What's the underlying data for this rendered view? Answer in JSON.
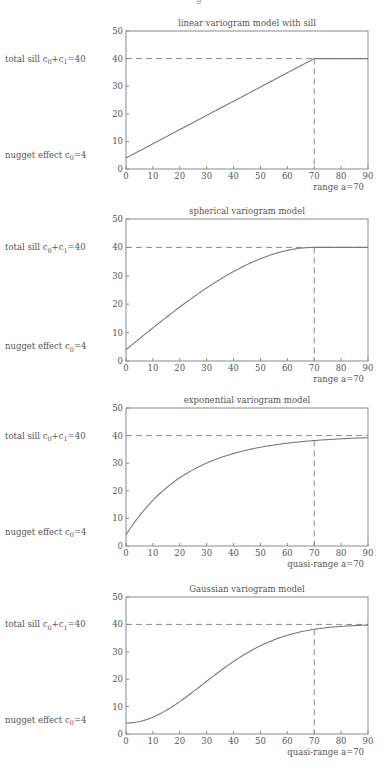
{
  "header_fragment": "g",
  "colors": {
    "axis": "#8a8a8a",
    "curve": "#7a7a7a",
    "dash": "#8a8a8a",
    "text": "#555555"
  },
  "layout": {
    "plot_left": 126,
    "plot_right": 368,
    "panels": [
      {
        "top": 31,
        "bottom": 169
      },
      {
        "top": 219,
        "bottom": 361
      },
      {
        "top": 408,
        "bottom": 546
      },
      {
        "top": 597,
        "bottom": 734
      }
    ]
  },
  "labels": {
    "total_sill": "total sill c0+c1=40",
    "nugget": "nugget effect c0=4"
  },
  "chart_data": [
    {
      "type": "line",
      "model": "linear_with_sill",
      "title": "linear variogram model with sill",
      "xlabel": "range a=70",
      "ylabel": "",
      "xlim": [
        0,
        90
      ],
      "ylim": [
        0,
        50
      ],
      "xticks": [
        0,
        10,
        20,
        30,
        40,
        50,
        60,
        70,
        80,
        90
      ],
      "yticks": [
        0,
        10,
        20,
        30,
        40,
        50
      ],
      "nugget": 4,
      "sill": 40,
      "range": 70,
      "x": [
        0,
        70,
        90
      ],
      "values": [
        4,
        40,
        40
      ],
      "annotations": [
        "total sill c0+c1=40",
        "nugget effect c0=4",
        "range a=70"
      ],
      "reference_lines": {
        "horizontal_dashed_y": 40,
        "vertical_dashed_x": 70
      },
      "grid": false
    },
    {
      "type": "line",
      "model": "spherical",
      "title": "spherical variogram model",
      "xlabel": "range a=70",
      "ylabel": "",
      "xlim": [
        0,
        90
      ],
      "ylim": [
        0,
        50
      ],
      "xticks": [
        0,
        10,
        20,
        30,
        40,
        50,
        60,
        70,
        80,
        90
      ],
      "yticks": [
        0,
        10,
        20,
        30,
        40,
        50
      ],
      "nugget": 4,
      "sill": 40,
      "range": 70,
      "x": [
        0,
        10,
        20,
        30,
        40,
        50,
        60,
        70,
        80,
        90
      ],
      "values": [
        4,
        11.6,
        18.9,
        25.5,
        31.1,
        35.6,
        38.7,
        40,
        40,
        40
      ],
      "annotations": [
        "total sill c0+c1=40",
        "nugget effect c0=4",
        "range a=70"
      ],
      "reference_lines": {
        "horizontal_dashed_y": 40,
        "vertical_dashed_x": 70
      },
      "grid": false
    },
    {
      "type": "line",
      "model": "exponential",
      "title": "exponential variogram model",
      "xlabel": "quasi-range a=70",
      "ylabel": "",
      "xlim": [
        0,
        90
      ],
      "ylim": [
        0,
        50
      ],
      "xticks": [
        0,
        10,
        20,
        30,
        40,
        50,
        60,
        70,
        80,
        90
      ],
      "yticks": [
        0,
        10,
        20,
        30,
        40,
        50
      ],
      "nugget": 4,
      "sill": 40,
      "range": 70,
      "x": [
        0,
        10,
        20,
        30,
        40,
        50,
        60,
        70,
        80,
        90
      ],
      "values": [
        4,
        16.2,
        24.7,
        30.5,
        34.5,
        37.2,
        39.0,
        38.2,
        38.8,
        39.2
      ],
      "annotations": [
        "total sill c0+c1=40",
        "nugget effect c0=4",
        "quasi-range a=70"
      ],
      "reference_lines": {
        "horizontal_dashed_y": 40,
        "vertical_dashed_x": 70
      },
      "grid": false
    },
    {
      "type": "line",
      "model": "gaussian",
      "title": "Gaussian variogram model",
      "xlabel": "quasi-range a=70",
      "ylabel": "",
      "xlim": [
        0,
        90
      ],
      "ylim": [
        0,
        50
      ],
      "xticks": [
        0,
        10,
        20,
        30,
        40,
        50,
        60,
        70,
        80,
        90
      ],
      "yticks": [
        0,
        10,
        20,
        30,
        40,
        50
      ],
      "nugget": 4,
      "sill": 40,
      "range": 70,
      "x": [
        0,
        10,
        20,
        30,
        40,
        50,
        60,
        70,
        80,
        90
      ],
      "values": [
        4,
        6.1,
        12.0,
        20.0,
        27.4,
        32.9,
        36.3,
        38.2,
        39.1,
        39.6
      ],
      "annotations": [
        "total sill c0+c1=40",
        "nugget effect c0=4",
        "quasi-range a=70"
      ],
      "reference_lines": {
        "horizontal_dashed_y": 40,
        "vertical_dashed_x": 70
      },
      "grid": false
    }
  ]
}
